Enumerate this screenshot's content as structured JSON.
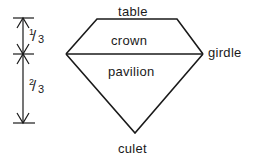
{
  "diagram": {
    "labels": {
      "table": "table",
      "crown": "crown",
      "girdle": "girdle",
      "pavilion": "pavilion",
      "culet": "culet"
    },
    "dimensions": {
      "upper": {
        "numerator": "1",
        "slash": "/",
        "denominator": "3"
      },
      "lower": {
        "numerator": "2",
        "slash": "/",
        "denominator": "3"
      }
    },
    "colors": {
      "line": "#1a1a1a",
      "background": "#ffffff"
    }
  }
}
